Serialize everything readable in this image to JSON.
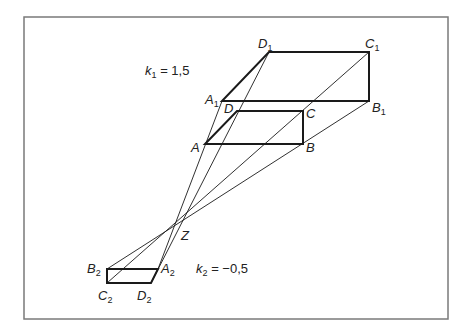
{
  "diagram": {
    "center": {
      "label": "Z",
      "x": 176,
      "y": 227
    },
    "original": {
      "A": {
        "label": "A",
        "x": 205,
        "y": 144
      },
      "B": {
        "label": "B",
        "x": 303,
        "y": 144
      },
      "C": {
        "label": "C",
        "x": 303,
        "y": 111
      },
      "D": {
        "label": "D",
        "x": 237,
        "y": 111
      }
    },
    "image1": {
      "factor_label": "k",
      "factor_sub": "1",
      "factor_text": " = 1,5",
      "A": {
        "label": "A",
        "sub": "1",
        "x": 222,
        "y": 101
      },
      "B": {
        "label": "B",
        "sub": "1",
        "x": 369,
        "y": 101
      },
      "C": {
        "label": "C",
        "sub": "1",
        "x": 369,
        "y": 52
      },
      "D": {
        "label": "D",
        "sub": "1",
        "x": 269,
        "y": 52
      }
    },
    "image2": {
      "factor_label": "k",
      "factor_sub": "2",
      "factor_text": " = −0,5",
      "A": {
        "label": "A",
        "sub": "2",
        "x": 158,
        "y": 269
      },
      "B": {
        "label": "B",
        "sub": "2",
        "x": 107,
        "y": 269
      },
      "C": {
        "label": "C",
        "sub": "2",
        "x": 107,
        "y": 283
      },
      "D": {
        "label": "D",
        "sub": "2",
        "x": 151,
        "y": 283
      }
    },
    "colors": {
      "stroke": "#1a1a1a",
      "frame": "#7a7a7a",
      "background": "#ffffff"
    }
  }
}
